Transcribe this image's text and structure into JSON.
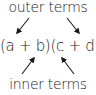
{
  "diagram": {
    "top_label": "outer terms",
    "expression": "(a + b)(c + d)",
    "bottom_label": "inner terms",
    "arrows": [
      {
        "from": "outer terms",
        "to": "a",
        "direction": "down-left"
      },
      {
        "from": "outer terms",
        "to": "d",
        "direction": "down-right"
      },
      {
        "from": "inner terms",
        "to": "b",
        "direction": "up-right"
      },
      {
        "from": "inner terms",
        "to": "c",
        "direction": "up-left"
      }
    ],
    "colors": {
      "text": "#1a1a1a",
      "background": "#ffffff"
    }
  }
}
